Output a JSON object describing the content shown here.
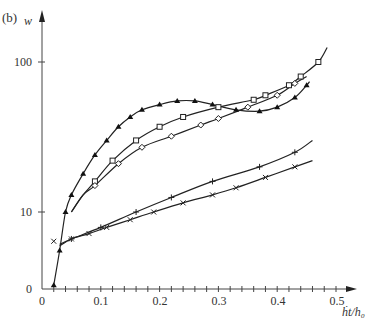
{
  "panel_label": "(b)",
  "chart_data": {
    "type": "line",
    "title": "",
    "xlabel": "ḣt/h₀",
    "ylabel": "w",
    "x_ticks": [
      "0",
      "0.1",
      "0.2",
      "0.3",
      "0.4",
      "0.5"
    ],
    "x_minor_tick_step": 0.02,
    "y_ticks": [
      "0",
      "10",
      "100"
    ],
    "y_scale": "log-like (0 to 10 compressed, 10 to 100 logarithmic)",
    "xlim": [
      0,
      0.52
    ],
    "ylim": [
      0,
      140
    ],
    "grid": false,
    "legend": "none (series distinguished by markers)",
    "series": [
      {
        "name": "filled-triangle",
        "marker": "▲",
        "x": [
          0.02,
          0.03,
          0.04,
          0.05,
          0.07,
          0.09,
          0.11,
          0.13,
          0.15,
          0.17,
          0.2,
          0.23,
          0.26,
          0.29,
          0.33,
          0.37,
          0.4,
          0.43,
          0.45
        ],
        "y": [
          0.5,
          5,
          10,
          13,
          18,
          24,
          30,
          37,
          43,
          48,
          52,
          55,
          55,
          52,
          48,
          47,
          50,
          58,
          70
        ]
      },
      {
        "name": "open-square",
        "marker": "□",
        "x": [
          0.09,
          0.12,
          0.16,
          0.2,
          0.24,
          0.3,
          0.36,
          0.38,
          0.42,
          0.44,
          0.47
        ],
        "y": [
          16,
          22,
          30,
          37,
          43,
          50,
          56,
          60,
          70,
          80,
          100
        ]
      },
      {
        "name": "open-diamond",
        "marker": "◇",
        "x": [
          0.09,
          0.13,
          0.17,
          0.22,
          0.27,
          0.3,
          0.35,
          0.4,
          0.43
        ],
        "y": [
          15,
          21,
          27,
          32,
          38,
          42,
          50,
          60,
          72
        ]
      },
      {
        "name": "plus",
        "marker": "+",
        "x": [
          0.05,
          0.1,
          0.16,
          0.22,
          0.29,
          0.37,
          0.43
        ],
        "y": [
          6.5,
          8,
          10,
          12.5,
          16,
          20,
          25
        ]
      },
      {
        "name": "cross",
        "marker": "×",
        "x": [
          0.02,
          0.05,
          0.08,
          0.11,
          0.15,
          0.19,
          0.24,
          0.29,
          0.33,
          0.38,
          0.43
        ],
        "y": [
          6.2,
          6.5,
          7.2,
          8,
          9,
          10,
          11.5,
          13,
          14.5,
          17,
          20
        ]
      }
    ]
  },
  "axes": {
    "x_label": "ḣt/h₀",
    "y_label": "w",
    "x_tick_labels": [
      "0",
      "0.1",
      "0.2",
      "0.3",
      "0.4",
      "0.5"
    ],
    "y_tick_labels": [
      "0",
      "10",
      "100"
    ]
  }
}
